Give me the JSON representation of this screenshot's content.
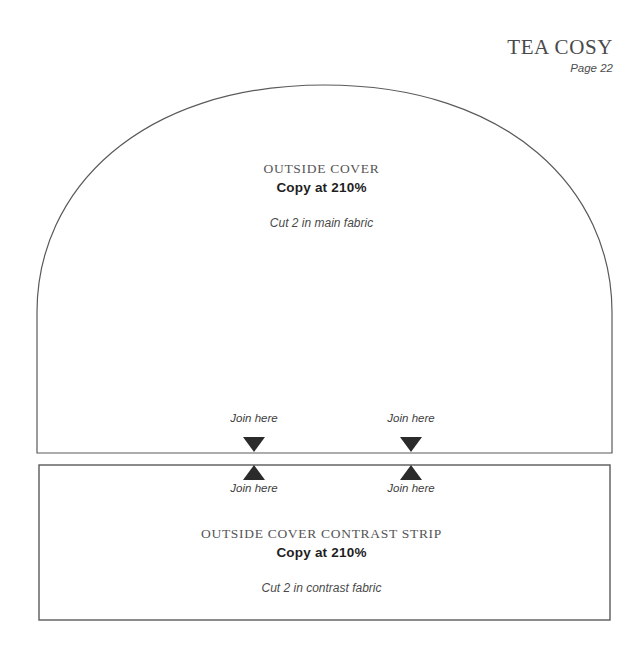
{
  "header": {
    "title": "TEA COSY",
    "page": "Page 22"
  },
  "outside_cover": {
    "name": "OUTSIDE COVER",
    "scale": "Copy at 210%",
    "instruction": "Cut 2 in main fabric"
  },
  "contrast_strip": {
    "name": "OUTSIDE COVER CONTRAST STRIP",
    "scale": "Copy at 210%",
    "instruction": "Cut 2 in contrast fabric"
  },
  "join_markers": [
    {
      "label": "Join here",
      "x": 254,
      "direction": "down",
      "label_y": 412,
      "marker_y": 437
    },
    {
      "label": "Join here",
      "x": 411,
      "direction": "down",
      "label_y": 412,
      "marker_y": 437
    },
    {
      "label": "Join here",
      "x": 254,
      "direction": "up",
      "label_y": 482,
      "marker_y": 465
    },
    {
      "label": "Join here",
      "x": 411,
      "direction": "up",
      "label_y": 482,
      "marker_y": 465
    }
  ],
  "colors": {
    "line": "#5a5a5a",
    "marker": "#2b2b2b",
    "paper": "#ffffff",
    "title_text": "#4a4a4a",
    "bold_text": "#1e1e1e"
  },
  "geometry": {
    "dome_left_x": 37,
    "dome_right_x": 612,
    "dome_apex_y": 85,
    "dome_shoulder_y": 312,
    "dome_bottom_y": 453,
    "strip_left_x": 39,
    "strip_right_x": 610,
    "strip_top_y": 465,
    "strip_bottom_y": 620
  }
}
